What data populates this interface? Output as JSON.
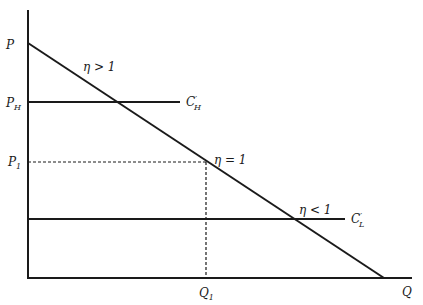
{
  "diagram": {
    "title": "",
    "axes": {
      "y_label": "P",
      "x_label": "Q"
    },
    "price_labels": {
      "p_high": {
        "main": "P",
        "sub": "H"
      },
      "p_one": {
        "main": "P",
        "sub": "1"
      }
    },
    "quantity_labels": {
      "q_one": {
        "main": "Q",
        "sub": "1"
      }
    },
    "curves": {
      "cost_high": {
        "main": "C",
        "prime": "′",
        "sub": "H"
      },
      "cost_low": {
        "main": "C",
        "prime": "′",
        "sub": "L"
      }
    },
    "annotations": {
      "elastic": "η > 1",
      "unit_elastic": "η = 1",
      "inelastic": "η < 1"
    },
    "colors": {
      "ink": "#1a1a1a",
      "background": "#ffffff"
    }
  }
}
